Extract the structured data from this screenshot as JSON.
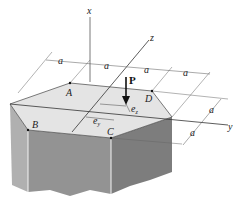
{
  "figure": {
    "axes": {
      "x": "x",
      "y": "y",
      "z": "z"
    },
    "load": {
      "label": "P"
    },
    "points": {
      "A": "A",
      "B": "B",
      "C": "C",
      "D": "D"
    },
    "dimensions": {
      "horizontal": [
        "a",
        "a",
        "a",
        "a"
      ],
      "depth": [
        "a",
        "a"
      ],
      "eccentricity_y": "e",
      "eccentricity_y_sub": "y",
      "eccentricity_z": "e",
      "eccentricity_z_sub": "z"
    },
    "colors": {
      "top_face": "#e4e4e4",
      "front_left_face": "#a8a8a8",
      "front_face": "#8c8c8c",
      "right_face": "#7a7a7a",
      "lines": "#333333"
    }
  }
}
